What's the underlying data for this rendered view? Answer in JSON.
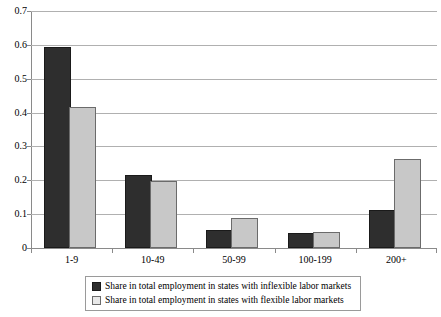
{
  "chart_data": {
    "type": "bar",
    "title": "",
    "subtitle": "",
    "xlabel": "",
    "ylabel": "",
    "categories": [
      "1-9",
      "10-49",
      "50-99",
      "100-199",
      "200+"
    ],
    "series": [
      {
        "name": "Share in total employment in states with inflexible labor markets",
        "color": "#2e2e2e",
        "values": [
          0.589,
          0.21,
          0.046,
          0.038,
          0.107
        ]
      },
      {
        "name": "Share in total employment in states with flexible labor markets",
        "color": "#c8c8c8",
        "values": [
          0.412,
          0.192,
          0.083,
          0.042,
          0.257
        ]
      }
    ],
    "ylim": [
      0,
      0.7
    ],
    "ytick_values": [
      0,
      0.1,
      0.2,
      0.3,
      0.4,
      0.5,
      0.6,
      0.7
    ],
    "ytick_labels": [
      "0",
      "0.1",
      "0.2",
      "0.3",
      "0.4",
      "0.5",
      "0.6",
      "0.7"
    ],
    "grid": true,
    "grid_axis": "y",
    "legend_position": "bottom",
    "bar_group_order": "inflexible-then-flexible"
  },
  "legend": {
    "entries": [
      {
        "marker": "filled-dark-square-icon",
        "label": "Share in total employment in states with inflexible labor markets"
      },
      {
        "marker": "filled-light-square-icon",
        "label": "Share in total employment in states with flexible labor markets"
      }
    ]
  },
  "colors": {
    "series_inflexible": "#2e2e2e",
    "series_flexible": "#c8c8c8",
    "gridline": "#b0b0b0",
    "axis": "#8a8a8a",
    "background": "#ffffff",
    "text": "#000000"
  }
}
